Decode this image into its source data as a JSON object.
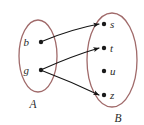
{
  "diagram": {
    "colors": {
      "ellipse_stroke": "#a06a6a",
      "arrow_stroke": "#141414",
      "dot_fill": "#1a1a1a",
      "label_fill": "#2a2a2a",
      "background": "#ffffff"
    },
    "sets": [
      {
        "id": "A",
        "label": "A",
        "label_x": 33,
        "label_y": 108,
        "ellipse": {
          "cx": 38,
          "cy": 56,
          "rx": 19,
          "ry": 36
        },
        "elements": [
          {
            "id": "b",
            "label": "b",
            "dot_x": 41,
            "dot_y": 42,
            "label_x": 29,
            "label_y": 46
          },
          {
            "id": "g",
            "label": "g",
            "dot_x": 41,
            "dot_y": 70,
            "label_x": 29,
            "label_y": 74
          }
        ]
      },
      {
        "id": "B",
        "label": "B",
        "label_x": 118,
        "label_y": 122,
        "ellipse": {
          "cx": 112,
          "cy": 60,
          "rx": 25,
          "ry": 47
        },
        "elements": [
          {
            "id": "s",
            "label": "s",
            "dot_x": 104,
            "dot_y": 24,
            "label_x": 110,
            "label_y": 28
          },
          {
            "id": "t",
            "label": "t",
            "dot_x": 104,
            "dot_y": 48,
            "label_x": 110,
            "label_y": 52
          },
          {
            "id": "u",
            "label": "u",
            "dot_x": 104,
            "dot_y": 71,
            "label_x": 110,
            "label_y": 75
          },
          {
            "id": "z",
            "label": "z",
            "dot_x": 104,
            "dot_y": 95,
            "label_x": 110,
            "label_y": 99
          }
        ]
      }
    ],
    "arrows": [
      {
        "id": "b-to-s",
        "from": "b",
        "to": "s",
        "path": "M 43 41 Q 72 29 99 24"
      },
      {
        "id": "g-to-t",
        "from": "g",
        "to": "t",
        "path": "M 43 69 Q 72 56 99 48"
      },
      {
        "id": "g-to-z",
        "from": "g",
        "to": "z",
        "path": "M 43 71 Q 72 82 99 95"
      }
    ]
  }
}
